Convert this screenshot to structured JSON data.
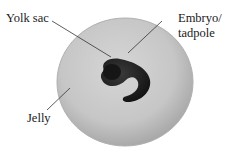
{
  "diagram": {
    "labels": {
      "yolk_sac": "Yolk sac",
      "embryo_line1": "Embryo/",
      "embryo_line2": "tadpole",
      "jelly": "Jelly"
    },
    "colors": {
      "background": "#ffffff",
      "jelly": "#c9c9c9",
      "jelly_edge": "#a8a8a8",
      "embryo": "#1c1c1c",
      "leader_line": "#333333",
      "text": "#1a1a1a"
    }
  }
}
